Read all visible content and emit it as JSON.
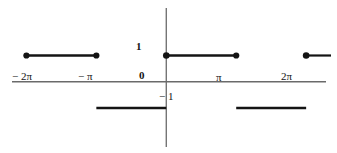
{
  "figure": {
    "title": "",
    "axes": {
      "x_axis_name": "x-axis",
      "y_axis_name": "y-axis"
    },
    "tick_labels": [
      {
        "name": "x-tick-neg-2pi",
        "text": "− 2π",
        "x_value": -6.2832,
        "px_x": 12,
        "px_y": 76
      },
      {
        "name": "x-tick-neg-pi",
        "text": "− π",
        "x_value": -3.1416,
        "px_x": 78,
        "px_y": 76
      },
      {
        "name": "x-tick-zero",
        "text": "0",
        "x_value": 0,
        "px_x": 139,
        "px_y": 75
      },
      {
        "name": "x-tick-pi",
        "text": "π",
        "x_value": 3.1416,
        "px_x": 216,
        "px_y": 77
      },
      {
        "name": "x-tick-2pi",
        "text": "2π",
        "x_value": 6.2832,
        "px_x": 281,
        "px_y": 76
      },
      {
        "name": "y-tick-one",
        "text": "1",
        "y_value": 1,
        "px_x": 136,
        "px_y": 41
      },
      {
        "name": "y-tick-neg-one",
        "text": "− 1",
        "y_value": -1,
        "px_x": 159,
        "px_y": 91
      }
    ]
  },
  "chart_data": {
    "type": "line",
    "title": "",
    "xlabel": "",
    "ylabel": "",
    "xlim": [
      -7.2,
      7.4
    ],
    "ylim": [
      -2.6,
      3.0
    ],
    "grid": false,
    "legend": null,
    "x_tick_values": [
      -6.2832,
      -3.1416,
      0,
      3.1416,
      6.2832
    ],
    "x_tick_text": [
      "− 2π",
      "− π",
      "0",
      "π",
      "2π"
    ],
    "y_tick_values": [
      1,
      -1
    ],
    "y_tick_text": [
      "1",
      "− 1"
    ],
    "series": [
      {
        "name": "step-function",
        "color": "#141414",
        "segments": [
          {
            "name": "segment-neg2pi-to-negpi",
            "x_start": -6.2832,
            "x_end": -3.1416,
            "y": 1,
            "dot_start": true,
            "dot_end": true
          },
          {
            "name": "segment-negpi-to-zero",
            "x_start": -3.1416,
            "x_end": 0,
            "y": -1,
            "dot_start": false,
            "dot_end": false
          },
          {
            "name": "segment-zero-to-pi",
            "x_start": 0,
            "x_end": 3.1416,
            "y": 1,
            "dot_start": true,
            "dot_end": true
          },
          {
            "name": "segment-pi-to-2pi",
            "x_start": 3.1416,
            "x_end": 6.2832,
            "y": -1,
            "dot_start": false,
            "dot_end": false
          },
          {
            "name": "segment-2pi-to-right",
            "x_start": 6.2832,
            "x_end": 7.4,
            "y": 1,
            "dot_start": true,
            "dot_end": false
          }
        ]
      }
    ],
    "points": [
      {
        "name": "point-neg2pi-one",
        "x": -6.2832,
        "y": 1,
        "filled": true
      },
      {
        "name": "point-negpi-one",
        "x": -3.1416,
        "y": 1,
        "filled": true
      },
      {
        "name": "point-zero-one",
        "x": 0,
        "y": 1,
        "filled": true
      },
      {
        "name": "point-pi-one",
        "x": 3.1416,
        "y": 1,
        "filled": true
      },
      {
        "name": "point-2pi-one",
        "x": 6.2832,
        "y": 1,
        "filled": true
      }
    ]
  },
  "style": {
    "line_color": "#141414",
    "axis_color": "#5a5a5a",
    "background": "#ffffff"
  }
}
